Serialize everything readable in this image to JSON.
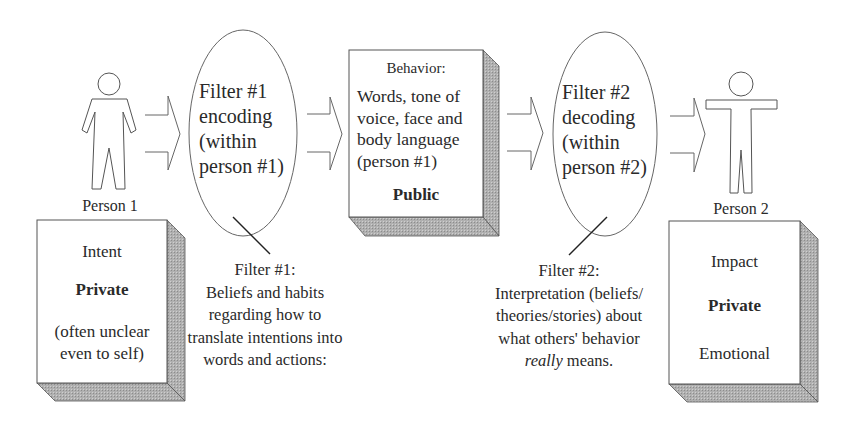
{
  "diagram": {
    "type": "communication-flow",
    "colors": {
      "stroke": "#555555",
      "shadow": "#a9a9a9",
      "text": "#2a2a2a",
      "background": "#ffffff"
    },
    "person1": {
      "icon": "person-standing-icon",
      "label": "Person 1",
      "box": {
        "line1": "Intent",
        "line2": "Private",
        "line3": "(often unclear",
        "line4": "even to self)"
      }
    },
    "filter1": {
      "ellipse": {
        "line1": "Filter #1",
        "line2": "encoding",
        "line3": "(within",
        "line4": "person #1)"
      },
      "caption": {
        "line1": "Filter #1:",
        "line2": "Beliefs and habits",
        "line3": "regarding how to",
        "line4": "translate intentions into",
        "line5": "words and actions:"
      }
    },
    "behavior": {
      "box": {
        "title": "Behavior:",
        "line1": "Words, tone of",
        "line2": "voice, face and",
        "line3": "body language",
        "line4": "(person #1)",
        "emphasis": "Public"
      }
    },
    "filter2": {
      "ellipse": {
        "line1": "Filter #2",
        "line2": "decoding",
        "line3": "(within",
        "line4": "person #2)"
      },
      "caption": {
        "line1": "Filter #2:",
        "line2": "Interpretation (beliefs/",
        "line3": "theories/stories) about",
        "line4": "what others' behavior",
        "line5_italic": "really",
        "line5_rest": " means."
      }
    },
    "person2": {
      "icon": "person-arms-out-icon",
      "label": "Person 2",
      "box": {
        "line1": "Impact",
        "line2": "Private",
        "line3": "Emotional"
      }
    },
    "arrows": [
      "arrow-person1-to-filter1",
      "arrow-filter1-to-behavior",
      "arrow-behavior-to-filter2",
      "arrow-filter2-to-person2"
    ]
  }
}
